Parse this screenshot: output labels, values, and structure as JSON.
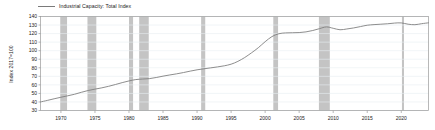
{
  "chart_data": {
    "type": "line",
    "title": "",
    "subtitle": "",
    "xlabel": "",
    "ylabel": "Index 2017=100",
    "xlim": [
      1967.0,
      2024.0
    ],
    "ylim": [
      30,
      140
    ],
    "grid": true,
    "grid_axis": "y",
    "legend_position": "top-left",
    "legend": [
      "Industrial Capacity: Total Index"
    ],
    "ytick_labels": [
      "140",
      "130",
      "120",
      "110",
      "100",
      "90",
      "80",
      "70",
      "60",
      "50",
      "40",
      "30"
    ],
    "ytick_values": [
      140,
      130,
      120,
      110,
      100,
      90,
      80,
      70,
      60,
      50,
      40,
      30
    ],
    "xtick_labels": [
      "1970",
      "1975",
      "1980",
      "1985",
      "1990",
      "1995",
      "2000",
      "2005",
      "2010",
      "2015",
      "2020"
    ],
    "xtick_values": [
      1970,
      1975,
      1980,
      1985,
      1990,
      1995,
      2000,
      2005,
      2010,
      2015,
      2020
    ],
    "series": [
      {
        "name": "Industrial Capacity: Total Index",
        "color": "#808080",
        "x": [
          1967.0,
          1968.0,
          1969.0,
          1970.0,
          1971.0,
          1972.0,
          1973.0,
          1974.0,
          1975.0,
          1976.0,
          1977.0,
          1978.0,
          1979.0,
          1980.0,
          1981.0,
          1982.0,
          1983.0,
          1984.0,
          1985.0,
          1986.0,
          1987.0,
          1988.0,
          1989.0,
          1990.0,
          1991.0,
          1992.0,
          1993.0,
          1994.0,
          1995.0,
          1996.0,
          1997.0,
          1998.0,
          1999.0,
          2000.0,
          2001.0,
          2002.0,
          2003.0,
          2004.0,
          2005.0,
          2006.0,
          2007.0,
          2008.0,
          2009.0,
          2010.0,
          2011.0,
          2012.0,
          2013.0,
          2014.0,
          2015.0,
          2016.0,
          2017.0,
          2018.0,
          2019.0,
          2020.0,
          2021.0,
          2022.0,
          2023.0,
          2024.0
        ],
        "y": [
          40.0,
          41.8,
          43.7,
          45.5,
          47.2,
          49.0,
          51.3,
          53.4,
          55.0,
          56.5,
          58.3,
          60.4,
          62.6,
          64.6,
          66.2,
          66.8,
          67.3,
          68.6,
          70.2,
          71.6,
          72.9,
          74.4,
          76.1,
          77.6,
          78.8,
          79.9,
          81.0,
          82.3,
          84.2,
          87.5,
          92.0,
          97.5,
          103.5,
          110.5,
          116.5,
          119.8,
          120.8,
          121.0,
          121.2,
          122.0,
          123.6,
          125.8,
          127.8,
          126.2,
          124.5,
          125.4,
          126.6,
          128.2,
          129.8,
          130.5,
          131.0,
          131.5,
          132.3,
          132.5,
          131.0,
          130.4,
          131.6,
          132.6
        ]
      }
    ],
    "recession_bands": [
      {
        "start": 1969.9,
        "end": 1970.9
      },
      {
        "start": 1973.9,
        "end": 1975.2
      },
      {
        "start": 1980.0,
        "end": 1980.6
      },
      {
        "start": 1981.5,
        "end": 1982.9
      },
      {
        "start": 1990.6,
        "end": 1991.2
      },
      {
        "start": 2001.2,
        "end": 2001.9
      },
      {
        "start": 2007.9,
        "end": 2009.5
      },
      {
        "start": 2020.1,
        "end": 2020.4
      }
    ],
    "band_color": "#c4c4c4",
    "axis_color": "#9a9a9a",
    "grid_color": "#e8eef2",
    "background": "#ffffff"
  }
}
